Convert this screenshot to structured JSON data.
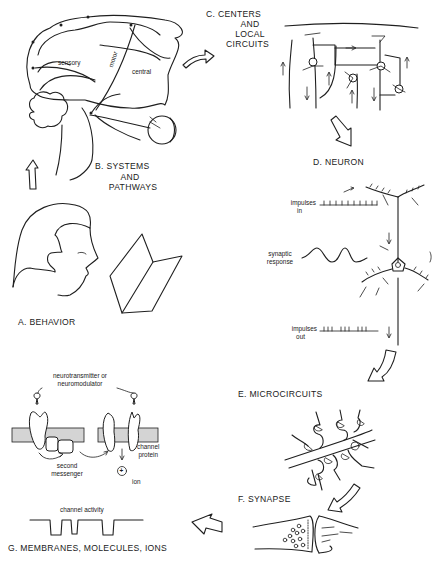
{
  "figure": {
    "panels": [
      {
        "id": "A",
        "label": "A.  BEHAVIOR"
      },
      {
        "id": "B",
        "label_lines": [
          "B.  SYSTEMS",
          "AND",
          "PATHWAYS"
        ]
      },
      {
        "id": "C",
        "label_lines": [
          "C.  CENTERS",
          "AND",
          "LOCAL",
          "CIRCUITS"
        ]
      },
      {
        "id": "D",
        "label": "D.  NEURON"
      },
      {
        "id": "E",
        "label": "E.  MICROCIRCUITS"
      },
      {
        "id": "F",
        "label": "F.  SYNAPSE"
      },
      {
        "id": "G",
        "label": "G.  MEMBRANES, MOLECULES, IONS"
      }
    ],
    "annotations": {
      "systems": {
        "sensory": "sensory",
        "motor": "motor",
        "central": "central"
      },
      "neuron": {
        "impulses_in": [
          "impulses",
          "in"
        ],
        "synaptic_response": [
          "synaptic",
          "response"
        ],
        "impulses_out": [
          "impulses",
          "out"
        ]
      },
      "membranes": {
        "neurotransmitter": [
          "neurotransmitter or",
          "neuromodulator"
        ],
        "second_messenger": [
          "second",
          "messenger"
        ],
        "channel_protein": [
          "channel",
          "protein"
        ],
        "ion": "ion",
        "ion_symbol": "+",
        "channel_activity": "channel activity"
      }
    },
    "flow_order": [
      "A",
      "B",
      "C",
      "D",
      "E",
      "F",
      "G"
    ]
  }
}
